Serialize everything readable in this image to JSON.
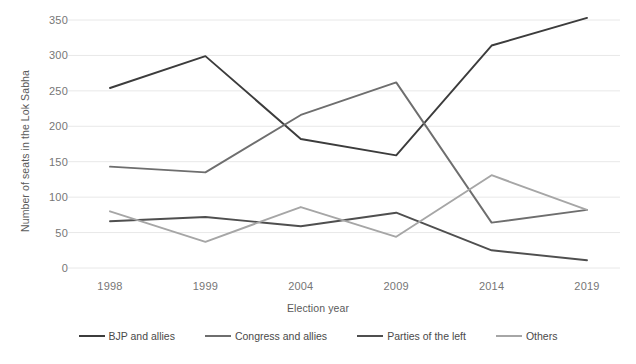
{
  "chart_data": {
    "type": "line",
    "title": "",
    "xlabel": "Election year",
    "ylabel": "Number of seats in the Lok Sabha",
    "categories": [
      "1998",
      "1999",
      "2004",
      "2009",
      "2014",
      "2019"
    ],
    "ylim": [
      0,
      350
    ],
    "yticks": [
      0,
      50,
      100,
      150,
      200,
      250,
      300,
      350
    ],
    "ytick_labels": [
      "0",
      "50",
      "100",
      "150",
      "200",
      "250",
      "300",
      "350"
    ],
    "grid": "horizontal",
    "legend_position": "bottom",
    "series": [
      {
        "name": "BJP and allies",
        "color": "#3c3c3c",
        "values": [
          254,
          299,
          182,
          159,
          314,
          353
        ]
      },
      {
        "name": "Congress and allies",
        "color": "#6e6e6e",
        "values": [
          143,
          135,
          216,
          262,
          64,
          82
        ]
      },
      {
        "name": "Parties of the left",
        "color": "#4f4f4f",
        "values": [
          66,
          72,
          59,
          78,
          25,
          11
        ]
      },
      {
        "name": "Others",
        "color": "#a6a6a6",
        "values": [
          80,
          37,
          86,
          44,
          131,
          82
        ]
      }
    ]
  },
  "axis": {
    "y_title": "Number of seats in the Lok Sabha",
    "x_title": "Election year"
  },
  "legend": {
    "items": [
      {
        "label": "BJP and allies",
        "color": "#3c3c3c"
      },
      {
        "label": "Congress and allies",
        "color": "#6e6e6e"
      },
      {
        "label": "Parties of the left",
        "color": "#4f4f4f"
      },
      {
        "label": "Others",
        "color": "#a6a6a6"
      }
    ]
  }
}
